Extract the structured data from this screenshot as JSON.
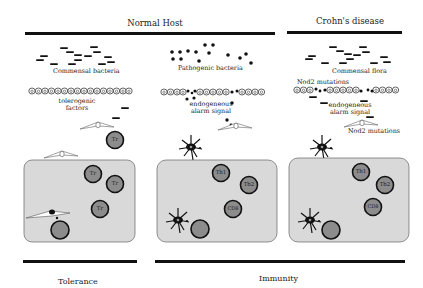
{
  "headers": {
    "normal_host": "Normal Host",
    "crohns": "Crohn's disease"
  },
  "footers": {
    "tolerance": "Tolerance",
    "immunity": "Immunity"
  },
  "panels": [
    {
      "id": "normal-tolerance",
      "bacteria_label": "Commensal bacteria",
      "bacteria_type": "rods",
      "signal_label_1": "tolerogenic",
      "signal_label_2": "factors",
      "cells": [
        "Tr",
        "Tr",
        "Tr",
        "Tr",
        ""
      ]
    },
    {
      "id": "normal-immunity",
      "bacteria_label": "Pathogenic bacteria",
      "bacteria_type": "cocci",
      "signal_label_1": "endogeneous",
      "signal_label_2": "alarm signal",
      "cells": [
        "Th1",
        "Th2",
        "CD8",
        ""
      ]
    },
    {
      "id": "crohns-immunity",
      "bacteria_label": "Commensal flora",
      "bacteria_type": "rods",
      "mutation_label_top": "Nod2 mutations",
      "signal_label_1": "endogeneous",
      "signal_label_2": "alarm signal",
      "mutation_label_bottom": "Nod2 mutations",
      "cells": [
        "Th1",
        "Th2",
        "CD8",
        ""
      ]
    }
  ],
  "colors": {
    "tissue_fill": "#d9d9d9",
    "cell_fill": "#8c8c8c",
    "ink": "#111111"
  }
}
